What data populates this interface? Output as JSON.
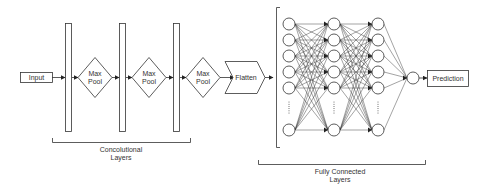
{
  "diagram": {
    "nodes": {
      "input": {
        "label": "Input"
      },
      "maxpool_1": {
        "label_line1": "Max",
        "label_line2": "Pool"
      },
      "maxpool_2": {
        "label_line1": "Max",
        "label_line2": "Pool"
      },
      "maxpool_3": {
        "label_line1": "Max",
        "label_line2": "Pool"
      },
      "flatten": {
        "label": "Flatten"
      },
      "prediction": {
        "label": "Prediction"
      }
    },
    "groups": {
      "conv": {
        "label_line1": "Concolutional",
        "label_line2": "Layers"
      },
      "fc": {
        "label_line1": "Fully Connected",
        "label_line2": "Layers"
      }
    },
    "fc_network": {
      "columns": 3,
      "visible_nodes_per_column": 6,
      "ellipsis": "......",
      "output_nodes": 1
    },
    "flow": [
      "Input",
      "Conv",
      "Max Pool",
      "Conv",
      "Max Pool",
      "Conv",
      "Max Pool",
      "Flatten",
      "Fully Connected Layers",
      "Prediction"
    ],
    "colors": {
      "stroke": "#333333",
      "background": "#ffffff",
      "text": "#333333"
    }
  }
}
